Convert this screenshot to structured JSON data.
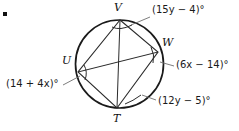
{
  "figure": {
    "type": "circle-inscribed-quadrilateral",
    "bullet": "▪",
    "circle": {
      "cx": 119.5,
      "cy": 64,
      "r": 44,
      "stroke": "#1a1a1a",
      "stroke_width": 1.6
    },
    "vertices": [
      {
        "id": "V",
        "label": "V",
        "x": 120,
        "y": 20,
        "label_x": 115,
        "label_y": 3
      },
      {
        "id": "W",
        "label": "W",
        "x": 158,
        "y": 52,
        "label_x": 162,
        "label_y": 38
      },
      {
        "id": "T",
        "label": "T",
        "x": 117,
        "y": 108,
        "label_x": 113,
        "label_y": 114
      },
      {
        "id": "U",
        "label": "U",
        "x": 78,
        "y": 72,
        "label_x": 62,
        "label_y": 56
      }
    ],
    "quadrilateral_order": [
      "V",
      "W",
      "T",
      "U"
    ],
    "diagonals": [
      [
        "V",
        "T"
      ],
      [
        "U",
        "W"
      ]
    ],
    "angle_labels": [
      {
        "name": "angle-V",
        "vertex": "V",
        "text": "(15y − 4)°",
        "expression": "15y - 4",
        "x": 154,
        "y": 9,
        "leader": {
          "x1": 150,
          "y1": 17,
          "x2": 133,
          "y2": 25
        }
      },
      {
        "name": "angle-W",
        "vertex": "W",
        "text": "(6x − 14)°",
        "expression": "6x - 14",
        "x": 175,
        "y": 62,
        "leader": {
          "x1": 172,
          "y1": 66,
          "x2": 158,
          "y2": 62
        }
      },
      {
        "name": "angle-T",
        "vertex": "T",
        "text": "(12y − 5)°",
        "expression": "12y - 5",
        "x": 158,
        "y": 100,
        "leader": {
          "x1": 156,
          "y1": 101,
          "x2": 142,
          "y2": 96
        }
      },
      {
        "name": "angle-U",
        "vertex": "U",
        "text": "(14 + 4x)°",
        "expression": "14 + 4x",
        "x": 6,
        "y": 82,
        "leader": {
          "x1": 62,
          "y1": 86,
          "x2": 80,
          "y2": 77
        }
      }
    ],
    "arc_marks": [
      {
        "name": "arc-mark-V",
        "x1": 119,
        "y1": 27,
        "x2": 134,
        "y2": 25
      },
      {
        "name": "arc-mark-W",
        "x1": 152,
        "y1": 50,
        "x2": 156,
        "y2": 62
      },
      {
        "name": "arc-mark-T",
        "x1": 126,
        "y1": 103,
        "x2": 141,
        "y2": 96
      },
      {
        "name": "arc-mark-U",
        "x1": 82,
        "y1": 68,
        "x2": 85,
        "y2": 80
      }
    ]
  }
}
